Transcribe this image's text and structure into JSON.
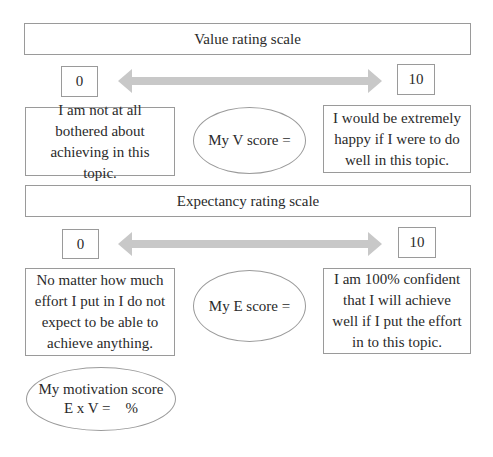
{
  "value_scale": {
    "title": "Value rating scale",
    "min_label": "0",
    "max_label": "10",
    "min_description": "I am not at all bothered about achieving in this topic.",
    "max_description": "I would be extremely happy if I were to do well in this topic.",
    "score_label": "My V score ="
  },
  "expectancy_scale": {
    "title": "Expectancy rating scale",
    "min_label": "0",
    "max_label": "10",
    "min_description": "No matter how much effort I put in I do not expect to be able to achieve anything.",
    "max_description": "I am 100% confident that I will achieve well if I put the effort in to this topic.",
    "score_label": "My E score ="
  },
  "motivation": {
    "line1": "My motivation score",
    "line2": "E x V =    %"
  },
  "colors": {
    "border": "#9a9a9a",
    "arrow": "#c8c8c8",
    "text": "#2a2a2a"
  }
}
